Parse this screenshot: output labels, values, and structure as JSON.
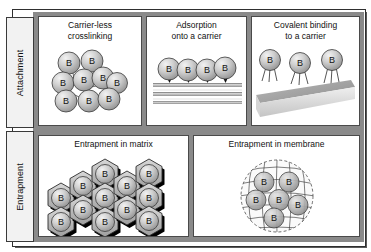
{
  "figure": {
    "bead_label": "B",
    "colors": {
      "frame": "#2f2f2f",
      "frame_shadow": "#5a5a5a",
      "band": "#8a8a8a",
      "panel_bg": "#ffffff",
      "tab_bg": "#f2f2f2",
      "bead_fill": "#c9c9c9",
      "bead_stroke": "#3a3a3a",
      "bead_highlight": "#f0f0f0",
      "hex_fill": "#b4b4b4",
      "hex_shadow": "#000000",
      "carrier": "#a8a8a8",
      "text": "#111111"
    }
  },
  "categories": [
    {
      "id": "attachment",
      "label": "Attachment"
    },
    {
      "id": "entrapment",
      "label": "Entrapment"
    }
  ],
  "panels": [
    {
      "id": "crosslink",
      "title_lines": [
        "Carrier-less",
        "crosslinking"
      ],
      "bead_count": 9,
      "description": "Cluster of enzyme beads joined by crosslinks"
    },
    {
      "id": "adsorption",
      "title_lines": [
        "Adsorption",
        "onto a carrier"
      ],
      "bead_count": 4,
      "description": "Beads adsorbed on a flat layered carrier"
    },
    {
      "id": "covalent",
      "title_lines": [
        "Covalent binding",
        "to a carrier"
      ],
      "bead_count": 3,
      "description": "Beads covalently bound by linker legs to an angled carrier slab"
    },
    {
      "id": "matrix",
      "title_lines": [
        "Entrapment in matrix"
      ],
      "bead_count": 12,
      "description": "Beads enclosed in a honeycomb hexagonal matrix"
    },
    {
      "id": "membrane",
      "title_lines": [
        "Entrapment in membrane"
      ],
      "bead_count": 6,
      "description": "Beads enclosed inside a spherical semi-permeable membrane mesh"
    }
  ]
}
